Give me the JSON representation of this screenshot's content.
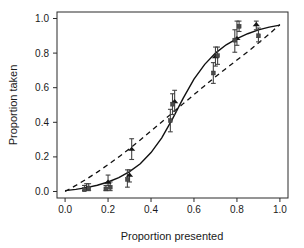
{
  "chart_data": {
    "type": "scatter",
    "title": "",
    "xlabel": "Proportion presented",
    "ylabel": "Proportion taken",
    "xlim": [
      0.0,
      1.0
    ],
    "ylim": [
      0.0,
      1.0
    ],
    "xticks": [
      "0.0",
      "0.2",
      "0.4",
      "0.6",
      "0.8",
      "1.0"
    ],
    "xtick_values": [
      0.0,
      0.2,
      0.4,
      0.6,
      0.8,
      1.0
    ],
    "yticks": [
      "0.0",
      "0.2",
      "0.4",
      "0.6",
      "0.8",
      "1.0"
    ],
    "ytick_values": [
      0.0,
      0.2,
      0.4,
      0.6,
      0.8,
      1.0
    ],
    "grid": false,
    "legend": "none",
    "frame": "box",
    "series": [
      {
        "name": "triangle-markers",
        "marker": "triangle",
        "x": [
          0.1,
          0.2,
          0.3,
          0.31,
          0.51,
          0.7,
          0.8,
          0.89
        ],
        "y": [
          0.02,
          0.055,
          0.095,
          0.245,
          0.52,
          0.78,
          0.885,
          0.965
        ],
        "yerr_low": [
          0.015,
          0.035,
          0.055,
          0.185,
          0.465,
          0.725,
          0.845,
          0.935
        ],
        "yerr_high": [
          0.045,
          0.095,
          0.125,
          0.305,
          0.585,
          0.835,
          0.985,
          0.985
        ]
      },
      {
        "name": "square-markers",
        "marker": "square",
        "x": [
          0.09,
          0.11,
          0.19,
          0.21,
          0.29,
          0.49,
          0.5,
          0.69,
          0.71,
          0.79,
          0.81,
          0.9
        ],
        "y": [
          0.01,
          0.02,
          0.015,
          0.025,
          0.07,
          0.41,
          0.505,
          0.685,
          0.785,
          0.875,
          0.955,
          0.9
        ],
        "yerr_low": [
          0.005,
          0.005,
          0.005,
          0.005,
          0.025,
          0.345,
          0.445,
          0.625,
          0.735,
          0.805,
          0.925,
          0.865
        ],
        "yerr_high": [
          0.035,
          0.045,
          0.035,
          0.055,
          0.125,
          0.475,
          0.565,
          0.745,
          0.835,
          0.935,
          0.985,
          0.945
        ]
      }
    ],
    "curves": [
      {
        "name": "sigmoid-fit",
        "style": "solid",
        "description": "S-shaped logistic fit through the data",
        "x": [
          0.0,
          0.05,
          0.1,
          0.15,
          0.2,
          0.25,
          0.3,
          0.35,
          0.4,
          0.45,
          0.5,
          0.55,
          0.6,
          0.65,
          0.7,
          0.75,
          0.8,
          0.85,
          0.9,
          0.95,
          1.0
        ],
        "y": [
          0.005,
          0.012,
          0.022,
          0.036,
          0.055,
          0.08,
          0.115,
          0.16,
          0.225,
          0.31,
          0.42,
          0.54,
          0.65,
          0.735,
          0.8,
          0.848,
          0.884,
          0.912,
          0.934,
          0.95,
          0.962
        ]
      },
      {
        "name": "reference-curve",
        "style": "dashed",
        "description": "Concave reference curve rising quickly then flattening",
        "x": [
          0.0,
          0.05,
          0.1,
          0.15,
          0.2,
          0.25,
          0.3,
          0.35,
          0.4,
          0.45,
          0.5,
          0.55,
          0.6,
          0.65,
          0.7,
          0.75,
          0.8,
          0.85,
          0.9,
          0.95,
          1.0
        ],
        "y": [
          0.0,
          0.035,
          0.072,
          0.112,
          0.155,
          0.2,
          0.248,
          0.298,
          0.35,
          0.402,
          0.455,
          0.508,
          0.56,
          0.612,
          0.663,
          0.712,
          0.76,
          0.808,
          0.858,
          0.91,
          0.965
        ]
      }
    ]
  },
  "axes": {
    "x_title": "Proportion presented",
    "y_title": "Proportion taken"
  },
  "colors": {
    "frame": "#2b2b2b",
    "solid_curve": "#111111",
    "dashed_curve": "#111111",
    "triangle_marker": "#151515",
    "square_marker": "#4a4a4a",
    "errorbar": "#444444",
    "background": "#ffffff"
  }
}
